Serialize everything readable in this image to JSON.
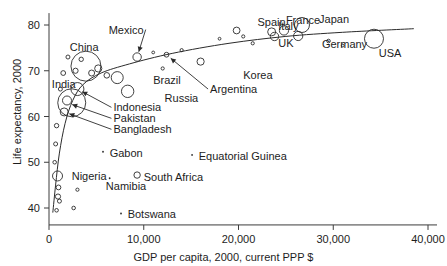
{
  "chart_data": {
    "type": "scatter",
    "title": "",
    "xlabel": "GDP per capita, 2000, current PPP $",
    "ylabel": "Life expectancy, 2000",
    "xlim": [
      0,
      40000
    ],
    "ylim": [
      36,
      83
    ],
    "xticks": [
      0,
      10000,
      20000,
      30000,
      40000
    ],
    "xtick_labels": [
      "0",
      "10,000",
      "20,000",
      "30,000",
      "40,000"
    ],
    "yticks": [
      40,
      50,
      60,
      70,
      80
    ],
    "ytick_labels": [
      "40",
      "50",
      "60",
      "70",
      "80"
    ],
    "grid": false,
    "legend": "none",
    "marker_note": "open circles sized by population; curve is a fitted trend line",
    "annotations": [
      {
        "label": "China",
        "x": 3900,
        "y": 71.0,
        "label_x": 2200,
        "label_y": 75.2,
        "arrow": false
      },
      {
        "label": "India",
        "x": 2400,
        "y": 63.0,
        "label_x": 300,
        "label_y": 67.0,
        "arrow": false
      },
      {
        "label": "Mexico",
        "x": 9300,
        "y": 73.0,
        "label_x": 6300,
        "label_y": 79.0,
        "arrow": true
      },
      {
        "label": "Brazil",
        "x": 7200,
        "y": 68.5,
        "label_x": 11000,
        "label_y": 68.0,
        "arrow": false
      },
      {
        "label": "Russia",
        "x": 8300,
        "y": 65.5,
        "label_x": 12200,
        "label_y": 64.0,
        "arrow": false
      },
      {
        "label": "Indonesia",
        "x": 3000,
        "y": 66.0,
        "label_x": 6800,
        "label_y": 62.0,
        "arrow": true
      },
      {
        "label": "Pakistan",
        "x": 1900,
        "y": 63.0,
        "label_x": 6800,
        "label_y": 59.6,
        "arrow": true
      },
      {
        "label": "Bangladesh",
        "x": 1600,
        "y": 61.0,
        "label_x": 6800,
        "label_y": 57.2,
        "arrow": true
      },
      {
        "label": "Argentina",
        "x": 12400,
        "y": 73.5,
        "label_x": 17000,
        "label_y": 66.0,
        "arrow": true
      },
      {
        "label": "Korea",
        "x": 16000,
        "y": 72.0,
        "label_x": 20500,
        "label_y": 69.0,
        "arrow": false
      },
      {
        "label": "Spain",
        "x": 19800,
        "y": 78.8,
        "label_x": 22000,
        "label_y": 80.6,
        "arrow": false
      },
      {
        "label": "Italy",
        "x": 23500,
        "y": 78.5,
        "label_x": 24200,
        "label_y": 79.8,
        "arrow": false
      },
      {
        "label": "France",
        "x": 24800,
        "y": 78.8,
        "label_x": 25000,
        "label_y": 81.0,
        "arrow": false
      },
      {
        "label": "Japan",
        "x": 26700,
        "y": 80.0,
        "label_x": 28500,
        "label_y": 81.4,
        "arrow": false
      },
      {
        "label": "UK",
        "x": 23800,
        "y": 77.5,
        "label_x": 24200,
        "label_y": 76.0,
        "arrow": false
      },
      {
        "label": "Germany",
        "x": 26300,
        "y": 77.6,
        "label_x": 28800,
        "label_y": 75.9,
        "arrow": false
      },
      {
        "label": "USA",
        "x": 34300,
        "y": 77.0,
        "label_x": 34800,
        "label_y": 73.8,
        "arrow": false
      },
      {
        "label": "Nigeria",
        "x": 900,
        "y": 47.0,
        "label_x": 2400,
        "label_y": 47.0,
        "arrow": false
      },
      {
        "label": "Gabon",
        "x": 5700,
        "y": 52.3,
        "label_x": 6400,
        "label_y": 52.0,
        "arrow": false
      },
      {
        "label": "Namibia",
        "x": 6400,
        "y": 46.5,
        "label_x": 6000,
        "label_y": 44.8,
        "arrow": false
      },
      {
        "label": "South Africa",
        "x": 9300,
        "y": 47.2,
        "label_x": 10000,
        "label_y": 46.8,
        "arrow": false
      },
      {
        "label": "Equatorial Guinea",
        "x": 15100,
        "y": 51.6,
        "label_x": 15800,
        "label_y": 51.4,
        "arrow": false
      },
      {
        "label": "Botswana",
        "x": 7600,
        "y": 38.8,
        "label_x": 8300,
        "label_y": 38.6,
        "arrow": false
      }
    ],
    "points": [
      {
        "x": 34300,
        "y": 77.0,
        "r": 9.5
      },
      {
        "x": 26700,
        "y": 80.0,
        "r": 7.5
      },
      {
        "x": 24800,
        "y": 78.8,
        "r": 4.6
      },
      {
        "x": 23500,
        "y": 78.5,
        "r": 4.0
      },
      {
        "x": 23800,
        "y": 77.5,
        "r": 4.2
      },
      {
        "x": 26300,
        "y": 77.6,
        "r": 4.6
      },
      {
        "x": 19800,
        "y": 78.8,
        "r": 3.4
      },
      {
        "x": 16000,
        "y": 72.0,
        "r": 3.6
      },
      {
        "x": 9300,
        "y": 73.0,
        "r": 4.2
      },
      {
        "x": 7200,
        "y": 68.5,
        "r": 6.0
      },
      {
        "x": 8300,
        "y": 65.5,
        "r": 6.2
      },
      {
        "x": 3900,
        "y": 71.0,
        "r": 15.0
      },
      {
        "x": 2400,
        "y": 63.0,
        "r": 14.0
      },
      {
        "x": 3000,
        "y": 66.0,
        "r": 6.5
      },
      {
        "x": 1900,
        "y": 63.5,
        "r": 4.5
      },
      {
        "x": 1600,
        "y": 61.0,
        "r": 4.0
      },
      {
        "x": 900,
        "y": 47.0,
        "r": 5.0
      },
      {
        "x": 9300,
        "y": 47.2,
        "r": 3.2
      },
      {
        "x": 12400,
        "y": 73.5,
        "r": 2.4
      },
      {
        "x": 5200,
        "y": 70.5,
        "r": 3.6
      },
      {
        "x": 4500,
        "y": 69.5,
        "r": 3.0
      },
      {
        "x": 6100,
        "y": 69.0,
        "r": 2.8
      },
      {
        "x": 2800,
        "y": 70.0,
        "r": 2.6
      },
      {
        "x": 3400,
        "y": 72.5,
        "r": 2.2
      },
      {
        "x": 2000,
        "y": 73.0,
        "r": 2.0
      },
      {
        "x": 1500,
        "y": 69.5,
        "r": 2.4
      },
      {
        "x": 1200,
        "y": 66.0,
        "r": 2.0
      },
      {
        "x": 800,
        "y": 58.0,
        "r": 2.2
      },
      {
        "x": 700,
        "y": 54.0,
        "r": 2.0
      },
      {
        "x": 600,
        "y": 50.0,
        "r": 1.8
      },
      {
        "x": 1000,
        "y": 44.5,
        "r": 2.4
      },
      {
        "x": 950,
        "y": 42.5,
        "r": 2.6
      },
      {
        "x": 1100,
        "y": 41.5,
        "r": 2.0
      },
      {
        "x": 800,
        "y": 39.5,
        "r": 1.8
      },
      {
        "x": 2600,
        "y": 40.0,
        "r": 1.8
      },
      {
        "x": 3000,
        "y": 44.0,
        "r": 1.6
      },
      {
        "x": 21500,
        "y": 76.0,
        "r": 1.6
      },
      {
        "x": 29500,
        "y": 76.5,
        "r": 1.8
      },
      {
        "x": 31000,
        "y": 75.5,
        "r": 1.4
      },
      {
        "x": 20500,
        "y": 77.5,
        "r": 1.6
      },
      {
        "x": 18000,
        "y": 77.0,
        "r": 1.4
      },
      {
        "x": 14000,
        "y": 74.5,
        "r": 1.6
      },
      {
        "x": 11000,
        "y": 74.0,
        "r": 1.4
      },
      {
        "x": 12000,
        "y": 70.5,
        "r": 1.6
      },
      {
        "x": 5700,
        "y": 52.3,
        "r": 1.2
      },
      {
        "x": 15100,
        "y": 51.6,
        "r": 1.2
      },
      {
        "x": 7600,
        "y": 38.8,
        "r": 1.2
      },
      {
        "x": 6400,
        "y": 46.5,
        "r": 1.2
      }
    ],
    "trend_line": [
      {
        "x": 400,
        "y": 39.0
      },
      {
        "x": 700,
        "y": 45.0
      },
      {
        "x": 1100,
        "y": 52.0
      },
      {
        "x": 1700,
        "y": 58.5
      },
      {
        "x": 2500,
        "y": 63.5
      },
      {
        "x": 3600,
        "y": 67.0
      },
      {
        "x": 5500,
        "y": 69.5
      },
      {
        "x": 8500,
        "y": 71.5
      },
      {
        "x": 13000,
        "y": 73.8
      },
      {
        "x": 19000,
        "y": 76.0
      },
      {
        "x": 25000,
        "y": 77.5
      },
      {
        "x": 31000,
        "y": 78.4
      },
      {
        "x": 38500,
        "y": 79.2
      }
    ]
  }
}
